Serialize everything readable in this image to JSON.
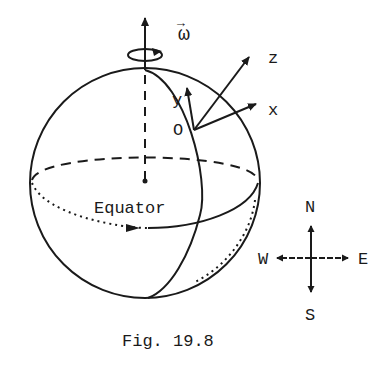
{
  "figure": {
    "caption": "Fig. 19.8",
    "colors": {
      "ink": "#1a1a1a",
      "background": "#ffffff"
    }
  },
  "sphere": {
    "rotation_vector_label": "ω",
    "rotation_vector_arrow": "→",
    "equator_label": "Equator"
  },
  "local_frame": {
    "origin_label": "O",
    "axes": [
      {
        "name": "x",
        "label": "x"
      },
      {
        "name": "y",
        "label": "y"
      },
      {
        "name": "z",
        "label": "z"
      }
    ]
  },
  "compass": {
    "north": "N",
    "south": "S",
    "east": "E",
    "west": "W"
  }
}
